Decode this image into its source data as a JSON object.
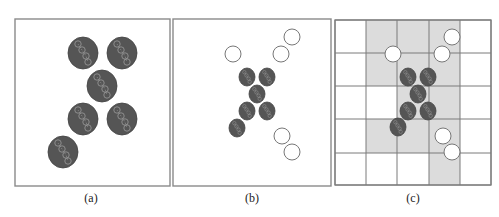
{
  "figure": {
    "colors": {
      "frame": "#8a8a8a",
      "grid_line": "#7a7a7a",
      "shaded_cell": "#dcdcdc",
      "dark_particle": "#555555",
      "particle_outline": "#444444",
      "glyph": "#9a9a9a",
      "open_circle": "#777777"
    },
    "panels": [
      {
        "id": "a",
        "caption": "(a)",
        "caption_x": 91,
        "frame": {
          "x": 15,
          "y": 19,
          "w": 155,
          "h": 167
        },
        "dark_particles": [
          {
            "cx": 83,
            "cy": 53,
            "rx": 15,
            "ry": 16
          },
          {
            "cx": 122,
            "cy": 53,
            "rx": 15,
            "ry": 16
          },
          {
            "cx": 102,
            "cy": 86,
            "rx": 15,
            "ry": 16
          },
          {
            "cx": 83,
            "cy": 119,
            "rx": 15,
            "ry": 16
          },
          {
            "cx": 122,
            "cy": 119,
            "rx": 15,
            "ry": 16
          },
          {
            "cx": 63,
            "cy": 152,
            "rx": 15,
            "ry": 16
          }
        ],
        "open_circles": []
      },
      {
        "id": "b",
        "caption": "(b)",
        "caption_x": 252,
        "frame": {
          "x": 173,
          "y": 19,
          "w": 158,
          "h": 167
        },
        "dark_particles": [
          {
            "cx": 247,
            "cy": 77,
            "rx": 8,
            "ry": 9
          },
          {
            "cx": 267,
            "cy": 77,
            "rx": 8,
            "ry": 9
          },
          {
            "cx": 257,
            "cy": 94,
            "rx": 8,
            "ry": 9
          },
          {
            "cx": 247,
            "cy": 111,
            "rx": 8,
            "ry": 9
          },
          {
            "cx": 267,
            "cy": 111,
            "rx": 8,
            "ry": 9
          },
          {
            "cx": 237,
            "cy": 128,
            "rx": 8,
            "ry": 9
          }
        ],
        "open_circles": [
          {
            "cx": 233,
            "cy": 54,
            "r": 8
          },
          {
            "cx": 281,
            "cy": 54,
            "r": 8
          },
          {
            "cx": 292,
            "cy": 37,
            "r": 8
          },
          {
            "cx": 282,
            "cy": 136,
            "r": 8
          },
          {
            "cx": 292,
            "cy": 152,
            "r": 8
          }
        ]
      },
      {
        "id": "c",
        "caption": "(c)",
        "caption_x": 413,
        "frame": {
          "x": 335,
          "y": 20,
          "w": 156,
          "h": 165
        },
        "grid": {
          "cols": [
            335,
            366,
            397,
            429,
            460,
            491
          ],
          "rows": [
            20,
            53,
            86,
            119,
            153,
            185
          ],
          "shaded": [
            [
              0,
              1
            ],
            [
              0,
              2
            ],
            [
              0,
              3
            ],
            [
              1,
              1
            ],
            [
              1,
              2
            ],
            [
              1,
              3
            ],
            [
              2,
              2
            ],
            [
              2,
              3
            ],
            [
              3,
              1
            ],
            [
              3,
              2
            ],
            [
              3,
              3
            ],
            [
              4,
              3
            ]
          ]
        },
        "dark_particles": [
          {
            "cx": 408,
            "cy": 77,
            "rx": 8,
            "ry": 9
          },
          {
            "cx": 428,
            "cy": 77,
            "rx": 8,
            "ry": 9
          },
          {
            "cx": 418,
            "cy": 94,
            "rx": 8,
            "ry": 9
          },
          {
            "cx": 408,
            "cy": 111,
            "rx": 8,
            "ry": 9
          },
          {
            "cx": 428,
            "cy": 111,
            "rx": 8,
            "ry": 9
          },
          {
            "cx": 398,
            "cy": 127,
            "rx": 8,
            "ry": 9
          }
        ],
        "open_circles": [
          {
            "cx": 393,
            "cy": 54,
            "r": 8
          },
          {
            "cx": 442,
            "cy": 54,
            "r": 8
          },
          {
            "cx": 452,
            "cy": 37,
            "r": 8
          },
          {
            "cx": 443,
            "cy": 136,
            "r": 8
          },
          {
            "cx": 452,
            "cy": 152,
            "r": 8
          }
        ]
      }
    ]
  }
}
